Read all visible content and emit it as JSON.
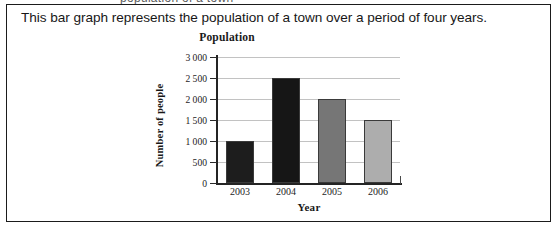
{
  "scan": {
    "top_cutoff_text": "population of a town"
  },
  "prompt": {
    "text": "This bar graph represents the population of a town over a period of four years."
  },
  "chart_data": {
    "type": "bar",
    "title": "Population",
    "xlabel": "Year",
    "ylabel": "Number of people",
    "categories": [
      "2003",
      "2004",
      "2005",
      "2006"
    ],
    "values": [
      1000,
      2500,
      2000,
      1500
    ],
    "ylim": [
      0,
      3000
    ],
    "ytick_labels": [
      "3 000",
      "2 500",
      "2 000",
      "1 500",
      "1 000",
      "500",
      "0"
    ],
    "ytick_values": [
      3000,
      2500,
      2000,
      1500,
      1000,
      500,
      0
    ],
    "grid": true,
    "legend": "none",
    "bar_colors": [
      "#1d1d1d",
      "#161616",
      "#767676",
      "#adadad"
    ]
  }
}
